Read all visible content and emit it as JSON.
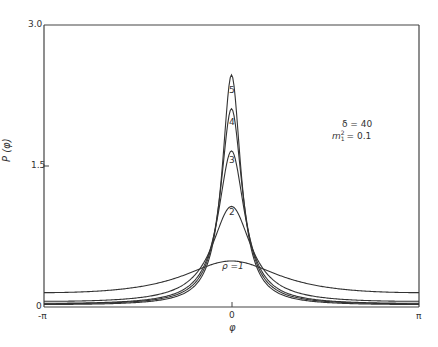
{
  "chart_data": {
    "type": "line",
    "title": "",
    "xlabel": "φ",
    "ylabel": "P (φ)",
    "xlim": [
      "-π",
      "π"
    ],
    "ylim": [
      0,
      3.0
    ],
    "grid": false,
    "x_ticks": [
      "-π",
      "0",
      "π"
    ],
    "y_ticks": [
      "0",
      "1.5",
      "3.0"
    ],
    "annotation": {
      "line1": "δ = 40",
      "line2": "m₁² = 0.1"
    },
    "series": [
      {
        "name": "ρ = 1",
        "label": "ρ =1",
        "peak": 0.49,
        "baseline": 0.06,
        "width": 1.05
      },
      {
        "name": "ρ = 2",
        "label": "2",
        "peak": 1.07,
        "baseline": 0.02,
        "width": 0.4
      },
      {
        "name": "ρ = 3",
        "label": "3",
        "peak": 1.66,
        "baseline": 0.01,
        "width": 0.27
      },
      {
        "name": "ρ = 4",
        "label": "4",
        "peak": 2.11,
        "baseline": 0.01,
        "width": 0.22
      },
      {
        "name": "ρ = 5",
        "label": "5",
        "peak": 2.47,
        "baseline": 0.005,
        "width": 0.19
      }
    ],
    "x": [
      -3.1416,
      -2.5,
      -2.0,
      -1.5,
      -1.0,
      -0.75,
      -0.5,
      -0.35,
      -0.2,
      -0.1,
      0,
      0.1,
      0.2,
      0.35,
      0.5,
      0.75,
      1.0,
      1.5,
      2.0,
      2.5,
      3.1416
    ]
  },
  "labels": {
    "y_tick_top": "3.0",
    "y_tick_mid": "1.5",
    "y_tick_zero": "0",
    "x_tick_left": "-π",
    "x_tick_mid": "0",
    "x_tick_right": "π",
    "y_axis_title": "P (φ)",
    "x_axis_title": "φ",
    "annot_delta": "δ = 40",
    "annot_m": "m",
    "annot_m_rest": "= 0.1",
    "curve_1": "ρ =1",
    "curve_2": "2",
    "curve_3": "3",
    "curve_4": "4",
    "curve_5": "5"
  }
}
